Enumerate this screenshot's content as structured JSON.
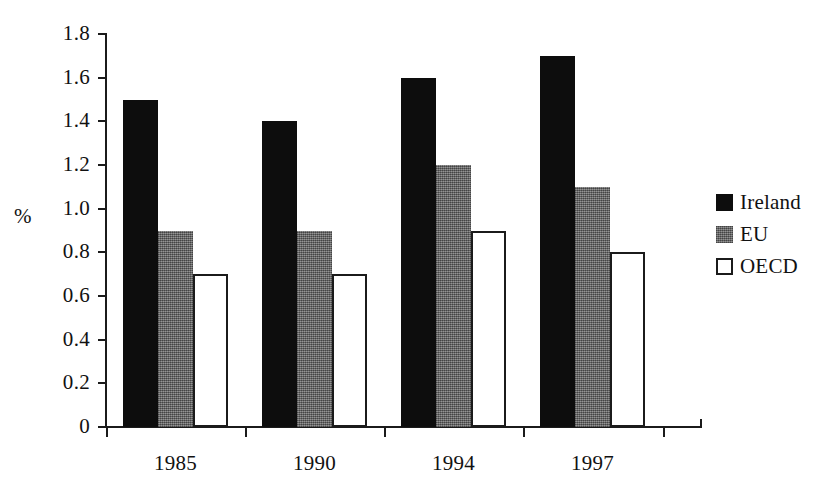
{
  "chart_data": {
    "type": "bar",
    "title": "",
    "subtitle": "",
    "xlabel": "",
    "ylabel": "%",
    "categories": [
      "1985",
      "1990",
      "1994",
      "1997"
    ],
    "series": [
      {
        "name": "Ireland",
        "values": [
          1.5,
          1.4,
          1.6,
          1.7
        ],
        "color": "#0d0d0d",
        "fill": "solid-black"
      },
      {
        "name": "EU",
        "values": [
          0.9,
          0.9,
          1.2,
          1.1
        ],
        "color": "#6a6a6a",
        "fill": "gray-halftone"
      },
      {
        "name": "OECD",
        "values": [
          0.7,
          0.7,
          0.9,
          0.8
        ],
        "color": "#ffffff",
        "fill": "white-outlined"
      }
    ],
    "ylim": [
      0,
      1.8
    ],
    "ytick_values": [
      1.8,
      1.6,
      1.4,
      1.2,
      1.0,
      0.8,
      0.6,
      0.4,
      0.2,
      0
    ],
    "ytick_labels": [
      "1.8",
      "1.6",
      "1.4",
      "1.2",
      "1.0",
      "0.8",
      "0.6",
      "0.4",
      "0.2",
      "0"
    ],
    "grid": false,
    "legend_position": "right",
    "legend_entries": [
      "Ireland",
      "EU",
      "OECD"
    ],
    "annotations": []
  },
  "axes": {
    "y_title": "%",
    "y_ticks": [
      {
        "label": "1.8",
        "value": 1.8
      },
      {
        "label": "1.6",
        "value": 1.6
      },
      {
        "label": "1.4",
        "value": 1.4
      },
      {
        "label": "1.2",
        "value": 1.2
      },
      {
        "label": "1.0",
        "value": 1.0
      },
      {
        "label": "0.8",
        "value": 0.8
      },
      {
        "label": "0.6",
        "value": 0.6
      },
      {
        "label": "0.4",
        "value": 0.4
      },
      {
        "label": "0.2",
        "value": 0.2
      },
      {
        "label": "0",
        "value": 0
      }
    ],
    "x_ticks": [
      {
        "label": "1985"
      },
      {
        "label": "1990"
      },
      {
        "label": "1994"
      },
      {
        "label": "1997"
      }
    ]
  },
  "legend": {
    "items": [
      {
        "label": "Ireland",
        "swatch": "solid-black-swatch"
      },
      {
        "label": "EU",
        "swatch": "gray-halftone-swatch"
      },
      {
        "label": "OECD",
        "swatch": "white-outlined-swatch"
      }
    ]
  }
}
